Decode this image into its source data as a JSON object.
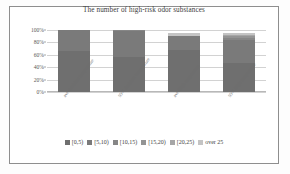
{
  "chart_data": {
    "type": "bar",
    "subtype": "100% stacked column",
    "title": "The number of high-risk odor substances",
    "xlabel": "",
    "ylabel": "",
    "ylim": [
      0,
      100
    ],
    "ytick_labels": [
      "100%",
      "80%",
      "60%",
      "40%",
      "20%",
      "0%"
    ],
    "ytick_values": [
      100,
      80,
      60,
      40,
      20,
      0
    ],
    "grid": true,
    "legend_position": "bottom",
    "categories": [
      "ave-Ambient temperature",
      "95% Ambient temperature",
      "ave-High temperature",
      "95% High temperature"
    ],
    "series": [
      {
        "name": "[0,5)",
        "color": "#6f6f6f",
        "values": [
          66,
          57,
          72,
          50
        ]
      },
      {
        "name": "[5,10)",
        "color": "#7a7a7a",
        "values": [
          34,
          42,
          23,
          38
        ]
      },
      {
        "name": "[10,15)",
        "color": "#868686",
        "values": [
          0,
          1,
          0,
          4
        ]
      },
      {
        "name": "[15,20)",
        "color": "#949494",
        "values": [
          0,
          0,
          0,
          3
        ]
      },
      {
        "name": "[20,25)",
        "color": "#a6a6a6",
        "values": [
          0,
          0,
          0,
          2
        ]
      },
      {
        "name": "over 25",
        "color": "#c4c4c4",
        "values": [
          0,
          0,
          5,
          3
        ]
      }
    ],
    "bar_tops_percent": [
      100,
      100,
      95,
      95
    ]
  },
  "legend": {
    "items": [
      {
        "label": "[0,5)",
        "color": "#6f6f6f"
      },
      {
        "label": "[5,10)",
        "color": "#7a7a7a"
      },
      {
        "label": "[10,15)",
        "color": "#868686"
      },
      {
        "label": "[15,20)",
        "color": "#949494"
      },
      {
        "label": "[20,25)",
        "color": "#a6a6a6"
      },
      {
        "label": "over 25",
        "color": "#c4c4c4"
      }
    ]
  }
}
